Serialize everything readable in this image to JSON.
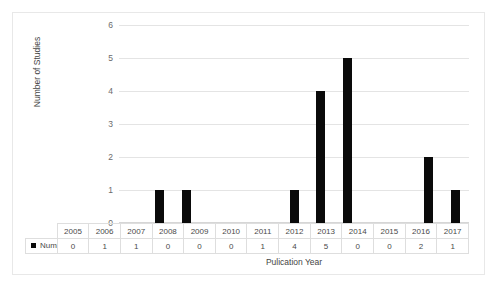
{
  "chart_data": {
    "type": "bar",
    "title": "",
    "xlabel": "Pulication Year",
    "ylabel": "Number of Studies",
    "categories": [
      "2005",
      "2006",
      "2007",
      "2008",
      "2009",
      "2010",
      "2011",
      "2012",
      "2013",
      "2014",
      "2015",
      "2016",
      "2017"
    ],
    "values": [
      0,
      1,
      1,
      0,
      0,
      0,
      1,
      4,
      5,
      0,
      0,
      2,
      1
    ],
    "series": [
      {
        "name": "Number of Studies",
        "values": [
          0,
          1,
          1,
          0,
          0,
          0,
          1,
          4,
          5,
          0,
          0,
          2,
          1
        ]
      }
    ],
    "ylim": [
      0,
      6
    ],
    "yticks": [
      "0",
      "1",
      "2",
      "3",
      "4",
      "5",
      "6"
    ],
    "ytick_values": [
      0,
      1,
      2,
      3,
      4,
      5,
      6
    ],
    "grid": true,
    "legend_position": "data-table-left",
    "bar_color": "#0a0a0a",
    "gridline_color": "#e4e4e4",
    "axis_text_color": "#6b6b6b"
  },
  "legend": {
    "series_label": "Number of Studies",
    "swatch_name": "black-square-marker"
  },
  "table": {
    "header_row": [
      "2005",
      "2006",
      "2007",
      "2008",
      "2009",
      "2010",
      "2011",
      "2012",
      "2013",
      "2014",
      "2015",
      "2016",
      "2017"
    ],
    "value_row": [
      "0",
      "1",
      "1",
      "0",
      "0",
      "0",
      "1",
      "4",
      "5",
      "0",
      "0",
      "2",
      "1"
    ]
  }
}
